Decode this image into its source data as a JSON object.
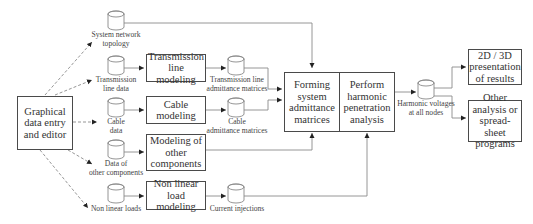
{
  "diagram": {
    "boxes": {
      "editor": "Graphical\ndata entry\nand editor",
      "transmission": "Transmission\nline modeling",
      "cable": "Cable\nmodeling",
      "other_components": "Modeling of\nother\ncomponents",
      "nonlinear": "Non linear\nload modeling",
      "forming": "Forming\nsystem\nadmittance\nmatrices",
      "perform": "Perform\nharmonic\npenetration\nanalysis",
      "presentation": "2D / 3D\npresentation\nof results",
      "other_analysis": "Other\nanalysis or\nspread-sheet\nprograms"
    },
    "databases": {
      "topology": "System network\ntopology",
      "line_data": "Transmission\nline data",
      "cable_data": "Cable\ndata",
      "other_data": "Data of\nother components",
      "nonlinear_loads": "Non linear loads",
      "line_admittance": "Transmission line\nadmittance matrices",
      "cable_admittance": "Cable\nadmittance matrices",
      "current_injections": "Current injections",
      "harmonic_voltages": "Harmonic voltages\nat all nodes"
    },
    "colors": {
      "line": "#8a8a8a",
      "box_border": "#4a4a4a",
      "text": "#333333"
    }
  }
}
